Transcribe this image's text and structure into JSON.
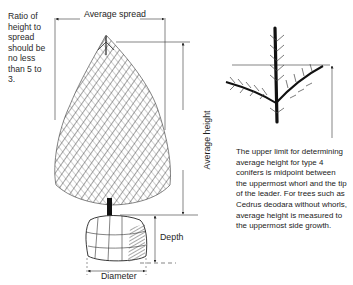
{
  "figure": {
    "ratio_note": "Ratio of height to spread should be no less than 5 to 3.",
    "labels": {
      "average_spread": "Average spread",
      "average_height": "Average height",
      "depth": "Depth",
      "diameter": "Diameter"
    },
    "whorl_note": "The upper limit for determining average height for type 4 conifers is midpoint between the uppermost whorl and the tip of the leader. For trees such as Cedrus deodara without whorls, average height is measured to the uppermost side growth."
  },
  "colors": {
    "ink": "#1a1a1a",
    "background": "#ffffff"
  }
}
